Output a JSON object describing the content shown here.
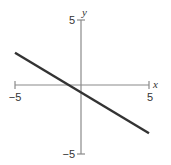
{
  "chart_data": {
    "type": "line",
    "title": "",
    "xlabel": "x",
    "ylabel": "y",
    "xlim": [
      -5,
      5
    ],
    "ylim": [
      -5,
      5
    ],
    "grid": false,
    "x_ticks": [
      {
        "value": -5,
        "label": "−5"
      },
      {
        "value": 5,
        "label": "5"
      }
    ],
    "y_ticks": [
      {
        "value": 5,
        "label": "5"
      },
      {
        "value": -5,
        "label": "−5"
      }
    ],
    "series": [
      {
        "name": "line",
        "equation": "y = -0.6x - 0.6",
        "x": [
          -5,
          5
        ],
        "y": [
          2.4,
          -3.6
        ],
        "color": "#333333"
      }
    ]
  },
  "colors": {
    "axis": "#888888",
    "line": "#333333",
    "text": "#333333"
  }
}
